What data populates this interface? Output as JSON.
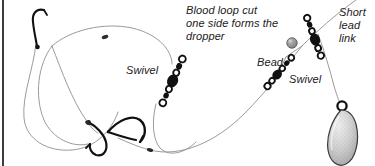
{
  "diagram": {
    "background_color": "#ffffff",
    "line_color": "#8c8c8c",
    "hardware_color": "#111111",
    "lead_fill_color": "#c9c9c9",
    "bead_color": "#8f8f8f",
    "border_color": "#3c3c3c"
  },
  "labels": {
    "blood_loop": "Blood loop cut\none side forms the\ndropper",
    "swivel_left": "Swivel",
    "bead": "Bead",
    "swivel_right": "Swivel",
    "short_lead_link": "Short\nlead\nlink"
  },
  "components": {
    "hooks": [
      "hook-top-left",
      "hook-lower-left",
      "hook-lower-middle"
    ],
    "swivels": [
      "swivel-assembly-left",
      "swivel-assembly-right",
      "swivel-assembly-lead-link"
    ],
    "bead": "bead-grey",
    "lead_weight": "lead-weight-teardrop",
    "knots": [
      "knot-upper-left",
      "knot-lower-left",
      "knot-lower-middle"
    ]
  }
}
